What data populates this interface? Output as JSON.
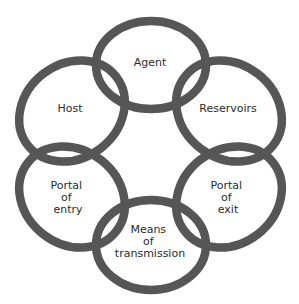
{
  "diagram": {
    "ring_color": "#565656",
    "nodes": [
      {
        "id": "agent",
        "lines": [
          "Agent"
        ]
      },
      {
        "id": "reservoirs",
        "lines": [
          "Reservoirs"
        ]
      },
      {
        "id": "portal-of-exit",
        "lines": [
          "Portal",
          "of",
          "exit"
        ]
      },
      {
        "id": "means-of-transmission",
        "lines": [
          "Means",
          "of",
          "transmission"
        ]
      },
      {
        "id": "portal-of-entry",
        "lines": [
          "Portal",
          "of",
          "entry"
        ]
      },
      {
        "id": "host",
        "lines": [
          "Host"
        ]
      }
    ],
    "links": [
      [
        "agent",
        "reservoirs"
      ],
      [
        "reservoirs",
        "portal-of-exit"
      ],
      [
        "portal-of-exit",
        "means-of-transmission"
      ],
      [
        "means-of-transmission",
        "portal-of-entry"
      ],
      [
        "portal-of-entry",
        "host"
      ],
      [
        "host",
        "agent"
      ]
    ]
  }
}
